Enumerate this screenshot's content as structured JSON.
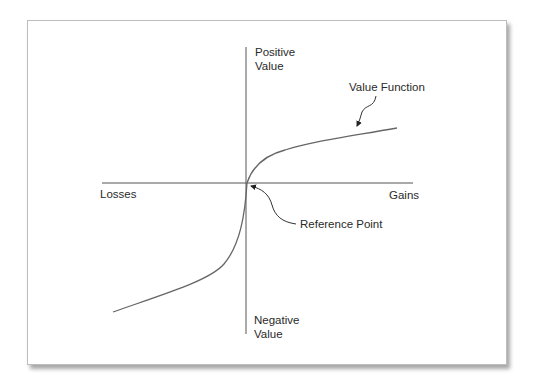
{
  "diagram": {
    "type": "value-function",
    "axes": {
      "y_top_label_line1": "Positive",
      "y_top_label_line2": "Value",
      "y_bottom_label_line1": "Negative",
      "y_bottom_label_line2": "Value",
      "x_left_label": "Losses",
      "x_right_label": "Gains"
    },
    "annotations": {
      "curve_label": "Value Function",
      "origin_label": "Reference Point"
    },
    "colors": {
      "stroke": "#555555",
      "text": "#2a2a2a",
      "frame_border": "#bdbdbd"
    }
  }
}
